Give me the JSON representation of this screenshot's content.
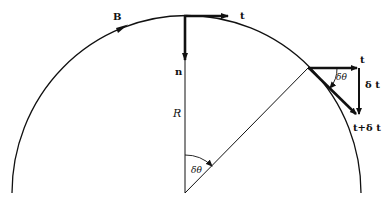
{
  "diagram": {
    "labels": {
      "field": "B",
      "tangent": "t",
      "normal": "n",
      "radius": "R",
      "angle_center": "δθ",
      "angle_triangle": "δθ",
      "tangent_2": "t",
      "delta_t": "δ t",
      "t_plus_delta_t": "t+δ t"
    },
    "colors": {
      "stroke": "#111111",
      "background": "#ffffff"
    }
  }
}
